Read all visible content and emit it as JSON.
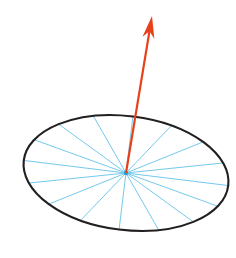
{
  "canvas": {
    "width": 236,
    "height": 258,
    "background": "#ffffff"
  },
  "figure": {
    "title": "",
    "kind": "geometric-diagram"
  },
  "ellipse": {
    "name": "disk-outline",
    "center_x": 126,
    "center_y": 173,
    "radius_x": 103,
    "radius_y": 57,
    "rotation_deg": 7,
    "stroke": "#231f20",
    "stroke_width": 2.1,
    "fill": "none"
  },
  "spokes": {
    "name": "radial-spokes",
    "count": 16,
    "stroke": "#64c3e8",
    "stroke_width": 0.9,
    "start_angle_deg": 0,
    "angles_deg": [
      0,
      22.5,
      45,
      67.5,
      90,
      112.5,
      135,
      157.5,
      180,
      202.5,
      225,
      247.5,
      270,
      292.5,
      315,
      337.5
    ]
  },
  "hub": {
    "name": "center-hub",
    "x": 126,
    "y": 173,
    "radius": 2.2,
    "color": "#2f9fd0"
  },
  "arrow": {
    "name": "normal-vector-arrow",
    "tail_x": 126,
    "tail_y": 173,
    "tip_x": 152,
    "tip_y": 16,
    "shaft_width": 2.2,
    "head_length": 22,
    "head_half_width": 6,
    "color": "#e8411a",
    "label": ""
  },
  "palette": {
    "outline": "#231f20",
    "spoke": "#64c3e8",
    "arrow": "#e8411a",
    "hub": "#2f9fd0",
    "background": "#ffffff"
  }
}
